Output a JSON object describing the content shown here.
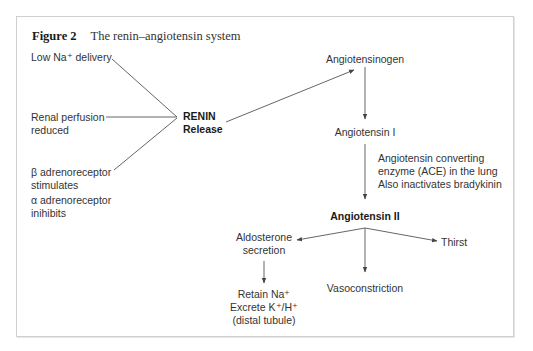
{
  "figure": {
    "label": "Figure 2",
    "title": "The renin–angiotensin system"
  },
  "stimuli": {
    "low_na": "Low Na⁺ delivery",
    "renal_1": "Renal perfusion",
    "renal_2": "reduced",
    "beta_1": "β adrenoreceptor",
    "beta_2": "stimulates",
    "alpha_1": "α adrenoreceptor",
    "alpha_2": "inihibits"
  },
  "renin": {
    "line1": "RENIN",
    "line2": "Release"
  },
  "cascade": {
    "angiotensinogen": "Angiotensinogen",
    "angiotensin_1": "Angiotensin I",
    "ace_1": "Angiotensin converting",
    "ace_2": "enzyme (ACE) in the lung",
    "ace_3": "Also inactivates bradykinin",
    "angiotensin_2": "Angiotensin II"
  },
  "effects": {
    "aldo_1": "Aldosterone",
    "aldo_2": "secretion",
    "thirst": "Thirst",
    "vaso": "Vasoconstriction",
    "retain_1": "Retain Na⁺",
    "retain_2": "Excrete K⁺/H⁺",
    "retain_3": "(distal tubule)"
  },
  "colors": {
    "line": "#555555",
    "border": "#cfcfcf",
    "text": "#333333"
  }
}
